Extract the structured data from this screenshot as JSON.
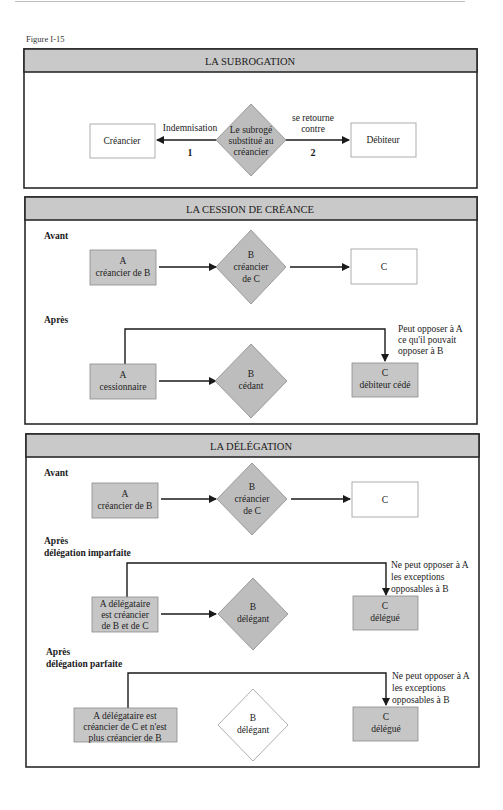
{
  "figure_label": "Figure I-15",
  "panels": {
    "subrogation": {
      "title": "LA SUBROGATION",
      "left_box": "Créancier",
      "center_diamond": [
        "Le subrogé",
        "substitué au",
        "créancier"
      ],
      "right_box": "Débiteur",
      "left_arrow_label": "Indemnisation",
      "left_arrow_number": "1",
      "right_arrow_label": [
        "se retourne",
        "contre"
      ],
      "right_arrow_number": "2"
    },
    "cession": {
      "title": "LA CESSION DE CRÉANCE",
      "before_label": "Avant",
      "before": {
        "a_box": [
          "A",
          "créancier de B"
        ],
        "b_diamond": [
          "B",
          "créancier",
          "de C"
        ],
        "c_box": "C"
      },
      "after_label": "Après",
      "after": {
        "a_box": [
          "A",
          "cessionnaire"
        ],
        "b_diamond": [
          "B",
          "cédant"
        ],
        "c_box": [
          "C",
          "débiteur cédé"
        ],
        "note": [
          "Peut opposer à A",
          "ce qu'il pouvait",
          "opposer à B"
        ]
      }
    },
    "delegation": {
      "title": "LA DÉLÉGATION",
      "before_label": "Avant",
      "before": {
        "a_box": [
          "A",
          "créancier de B"
        ],
        "b_diamond": [
          "B",
          "créancier",
          "de C"
        ],
        "c_box": "C"
      },
      "imperfect_label": [
        "Après",
        "délégation imparfaite"
      ],
      "imperfect": {
        "a_box": [
          "A délégataire",
          "est créancier",
          "de B et de C"
        ],
        "b_diamond": [
          "B",
          "délégant"
        ],
        "c_box": [
          "C",
          "délégué"
        ],
        "note": [
          "Ne peut opposer à A",
          "les exceptions",
          "opposables à B"
        ]
      },
      "perfect_label": [
        "Après",
        "délégation parfaite"
      ],
      "perfect": {
        "a_box": [
          "A  délégataire est",
          "créancier de C et n'est",
          "plus créancier de B"
        ],
        "b_diamond": [
          "B",
          "délégant"
        ],
        "c_box": [
          "C",
          "délégué"
        ],
        "note": [
          "Ne peut opposer à A",
          "les exceptions",
          "opposables à B"
        ]
      }
    }
  }
}
